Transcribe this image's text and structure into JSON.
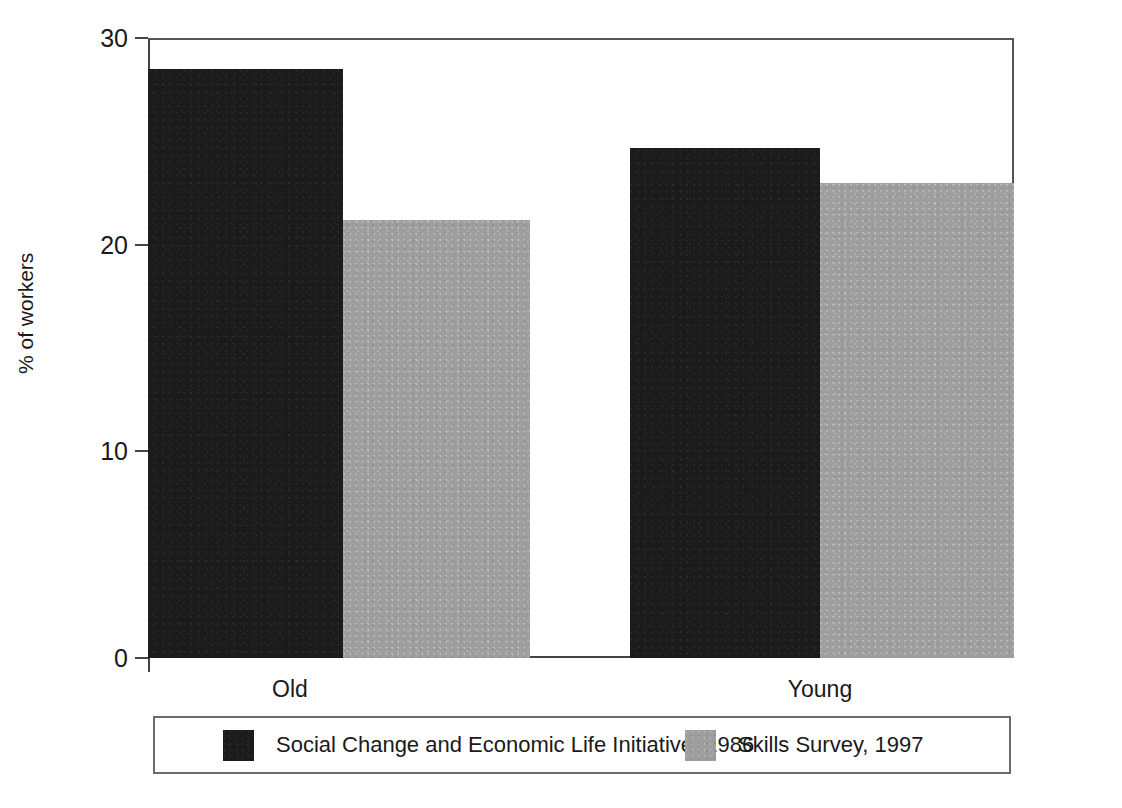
{
  "chart_data": {
    "type": "bar",
    "title": "",
    "xlabel": "",
    "ylabel": "% of workers",
    "categories": [
      "Old",
      "Young"
    ],
    "series": [
      {
        "name": "Social Change and Economic Life Initiative, 1986",
        "color": "#1b1b1b",
        "values": [
          28.5,
          24.7
        ]
      },
      {
        "name": "Skills Survey, 1997",
        "color": "#9e9e9e",
        "values": [
          21.2,
          23.0
        ]
      }
    ],
    "ylim": [
      0,
      30
    ],
    "yticks": [
      "0",
      "10",
      "20",
      "30"
    ],
    "ytick_values": [
      0,
      10,
      20,
      30
    ],
    "grid": false,
    "legend_position": "bottom"
  },
  "axes": {
    "y_title": "% of workers",
    "y_tick_labels": [
      "0",
      "10",
      "20",
      "30"
    ],
    "x_tick_labels": [
      "Old",
      "Young"
    ]
  },
  "legend": {
    "entries": [
      {
        "label": "Social Change and Economic Life Initiative, 1986",
        "swatch": "dark-swatch"
      },
      {
        "label": "Skills Survey, 1997",
        "swatch": "light-swatch"
      }
    ]
  }
}
